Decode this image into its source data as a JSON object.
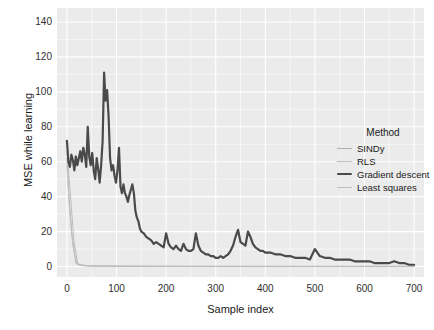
{
  "chart_data": {
    "type": "line",
    "title": "",
    "xlabel": "Sample index",
    "ylabel": "MSE while learning",
    "xlim": [
      -20,
      720
    ],
    "ylim": [
      -6,
      148
    ],
    "xticks": [
      0,
      100,
      200,
      300,
      400,
      500,
      600,
      700
    ],
    "yticks": [
      0,
      20,
      40,
      60,
      80,
      100,
      120,
      140
    ],
    "grid": true,
    "grid_color": "#ffffff",
    "panel_background": "#ebebeb",
    "legend": {
      "title": "Method",
      "position": "right",
      "entries": [
        {
          "name": "SINDy",
          "color": "#b0b0b0",
          "width": 1.0
        },
        {
          "name": "RLS",
          "color": "#c2c2c2",
          "width": 1.0
        },
        {
          "name": "Gradient descent",
          "color": "#4a4a4a",
          "width": 2.2
        },
        {
          "name": "Least squares",
          "color": "#bdbdbd",
          "width": 1.0
        }
      ]
    },
    "series": [
      {
        "name": "SINDy",
        "color": "#b0b0b0",
        "width": 1.0,
        "x": [
          0,
          4,
          10,
          18,
          30,
          60,
          120,
          250,
          400,
          550,
          700
        ],
        "values": [
          62,
          40,
          18,
          2,
          0.5,
          0.2,
          0.1,
          0.05,
          0.05,
          0.05,
          0.05
        ]
      },
      {
        "name": "RLS",
        "color": "#c2c2c2",
        "width": 1.0,
        "x": [
          0,
          5,
          12,
          20,
          40,
          100,
          200,
          350,
          500,
          700
        ],
        "values": [
          58,
          34,
          12,
          1.5,
          0.4,
          0.2,
          0.1,
          0.05,
          0.05,
          0.05
        ]
      },
      {
        "name": "Least squares",
        "color": "#bdbdbd",
        "width": 1.0,
        "x": [
          0,
          6,
          14,
          22,
          50,
          150,
          300,
          450,
          600,
          700
        ],
        "values": [
          66,
          45,
          15,
          1.0,
          0.3,
          0.15,
          0.08,
          0.05,
          0.05,
          0.05
        ]
      },
      {
        "name": "Gradient descent",
        "color": "#4a4a4a",
        "width": 2.2,
        "x": [
          0,
          3,
          6,
          9,
          12,
          15,
          18,
          21,
          24,
          27,
          30,
          33,
          36,
          39,
          42,
          45,
          48,
          51,
          54,
          57,
          60,
          63,
          66,
          69,
          72,
          75,
          78,
          81,
          84,
          87,
          90,
          93,
          96,
          99,
          102,
          105,
          108,
          111,
          114,
          117,
          120,
          123,
          126,
          129,
          132,
          135,
          138,
          141,
          144,
          147,
          150,
          155,
          160,
          165,
          170,
          175,
          180,
          185,
          190,
          195,
          200,
          205,
          210,
          215,
          220,
          225,
          230,
          235,
          240,
          245,
          250,
          255,
          260,
          265,
          270,
          275,
          280,
          285,
          290,
          295,
          300,
          305,
          310,
          315,
          320,
          325,
          330,
          335,
          340,
          345,
          350,
          355,
          360,
          365,
          370,
          375,
          380,
          385,
          390,
          395,
          400,
          410,
          420,
          430,
          440,
          450,
          460,
          470,
          480,
          490,
          500,
          510,
          520,
          530,
          540,
          550,
          560,
          570,
          580,
          590,
          600,
          610,
          620,
          630,
          640,
          650,
          660,
          670,
          680,
          690,
          700
        ],
        "values": [
          72,
          60,
          57,
          64,
          61,
          55,
          63,
          58,
          62,
          66,
          60,
          68,
          64,
          57,
          80,
          63,
          58,
          65,
          55,
          50,
          62,
          56,
          48,
          58,
          72,
          111,
          95,
          101,
          86,
          62,
          55,
          58,
          52,
          48,
          55,
          68,
          46,
          42,
          47,
          42,
          40,
          37,
          41,
          44,
          47,
          42,
          32,
          28,
          26,
          22,
          20,
          19,
          17,
          16,
          15,
          13,
          14,
          13,
          12,
          11,
          19,
          13,
          11,
          10,
          12,
          10,
          9,
          13,
          10,
          9,
          9,
          10,
          19,
          12,
          9,
          8,
          7,
          7,
          6,
          6,
          5,
          5,
          6,
          5,
          6,
          7,
          9,
          12,
          17,
          21,
          14,
          13,
          12,
          20,
          17,
          13,
          11,
          10,
          9,
          9,
          8,
          8,
          7,
          7,
          6,
          6,
          5,
          5,
          5,
          4,
          10,
          6,
          5,
          5,
          4,
          4,
          4,
          4,
          3,
          3,
          3,
          3,
          2,
          2,
          2,
          2,
          3,
          2,
          2,
          1,
          1
        ]
      }
    ]
  }
}
